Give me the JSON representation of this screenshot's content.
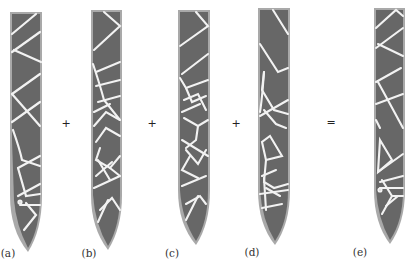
{
  "figure": {
    "colors": {
      "background": "#ffffff",
      "blade_fill": "#676767",
      "blade_border": "#a9a9a9",
      "crack": "#f2f2f2"
    },
    "panels": [
      {
        "label": "(a)",
        "x": 10,
        "w": 32,
        "top": 12,
        "tip_y": 252,
        "taper_start": 195
      },
      {
        "label": "(b)",
        "x": 91,
        "w": 31,
        "top": 10,
        "tip_y": 250,
        "taper_start": 195
      },
      {
        "label": "(c)",
        "x": 178,
        "w": 32,
        "top": 10,
        "tip_y": 245,
        "taper_start": 190
      },
      {
        "label": "(d)",
        "x": 258,
        "w": 32,
        "top": 8,
        "tip_y": 245,
        "taper_start": 190
      },
      {
        "label": "(e)",
        "x": 374,
        "w": 31,
        "top": 8,
        "tip_y": 244,
        "taper_start": 190
      }
    ],
    "operators": [
      "+",
      "+",
      "+",
      "="
    ],
    "operator_positions": [
      [
        66,
        123
      ],
      [
        152,
        123
      ],
      [
        236,
        123
      ],
      [
        331,
        122
      ]
    ],
    "label_y": 248,
    "label_positions": [
      6,
      109,
      196,
      277,
      392
    ]
  }
}
